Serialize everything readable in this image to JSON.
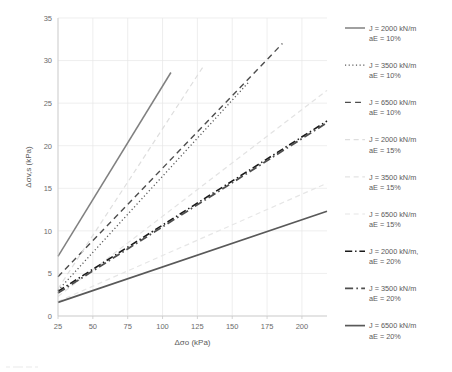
{
  "chart_data": {
    "type": "line",
    "title": "",
    "xlabel": "Δσo (kPa)",
    "ylabel": "Δσv,s (kPa)",
    "xlim": [
      25,
      218
    ],
    "ylim": [
      0,
      35
    ],
    "xticks": [
      25,
      50,
      75,
      100,
      125,
      150,
      175,
      200
    ],
    "yticks": [
      0,
      5,
      10,
      15,
      20,
      25,
      30,
      35
    ],
    "grid": true,
    "legend_position": "right",
    "series": [
      {
        "name": "J = 2000 kN/m aE = 10%",
        "label_line1": "J = 2000 kN/m",
        "label_line2": "aE = 10%",
        "color": "#808080",
        "width": 1.5,
        "dash": "none",
        "x": [
          25,
          106
        ],
        "y": [
          7.0,
          28.6
        ]
      },
      {
        "name": "J = 3500 kN/m aE = 10%",
        "label_line1": "J = 3500 kN/m",
        "label_line2": "aE = 10%",
        "color": "#595959",
        "width": 1.3,
        "dash": "dotted",
        "x": [
          25,
          162
        ],
        "y": [
          3.0,
          27.5
        ]
      },
      {
        "name": "J = 6500 kN/m aE = 10%",
        "label_line1": "J = 6500 kN/m",
        "label_line2": "aE = 10%",
        "color": "#4d4d4d",
        "width": 1.4,
        "dash": "dashed",
        "x": [
          25,
          186
        ],
        "y": [
          4.6,
          32.0
        ]
      },
      {
        "name": "J = 2000 kN/m aE = 15%",
        "label_line1": "J = 2000 kN/m",
        "label_line2": "aE = 15%",
        "color": "#dedede",
        "width": 1.2,
        "dash": "dashed",
        "x": [
          25,
          130
        ],
        "y": [
          3.2,
          29.5
        ]
      },
      {
        "name": "J = 3500 kN/m aE = 15%",
        "label_line1": "J = 3500 kN/m",
        "label_line2": "aE = 15%",
        "color": "#e3e3e3",
        "width": 1.2,
        "dash": "dashed",
        "x": [
          25,
          218
        ],
        "y": [
          2.3,
          26.5
        ]
      },
      {
        "name": "J = 6500 kN/m aE = 15%",
        "label_line1": "J = 6500 kN/m",
        "label_line2": "aE = 15%",
        "color": "#e6e6e6",
        "width": 1.2,
        "dash": "dashed",
        "x": [
          25,
          218
        ],
        "y": [
          1.7,
          15.6
        ]
      },
      {
        "name": "J = 2000 kN/m, aE = 20%",
        "label_line1": "J = 2000 kN/m,",
        "label_line2": "aE = 20%",
        "color": "#1a1a1a",
        "width": 1.6,
        "dash": "dashdot",
        "x": [
          25,
          218
        ],
        "y": [
          2.9,
          22.9
        ]
      },
      {
        "name": "J = 3500 kN/m aE = 20%",
        "label_line1": "J = 3500 kN/m",
        "label_line2": "aE = 20%",
        "color": "#4f4f4f",
        "width": 1.8,
        "dash": "dashdot",
        "x": [
          25,
          218
        ],
        "y": [
          2.7,
          22.7
        ]
      },
      {
        "name": "J = 6500 kN/m aE = 20%",
        "label_line1": "J = 6500 kN/m",
        "label_line2": "aE = 20%",
        "color": "#595959",
        "width": 1.7,
        "dash": "none",
        "x": [
          25,
          218
        ],
        "y": [
          1.6,
          12.3
        ]
      }
    ]
  },
  "legend": {
    "entries": [
      {
        "line1": "J = 2000 kN/m",
        "line2": "aE = 10%"
      },
      {
        "line1": "J = 3500 kN/m",
        "line2": "aE = 10%"
      },
      {
        "line1": "J = 6500 kN/m",
        "line2": "aE = 10%"
      },
      {
        "line1": "J = 2000 kN/m",
        "line2": "aE = 15%"
      },
      {
        "line1": "J = 3500 kN/m",
        "line2": "aE = 15%"
      },
      {
        "line1": "J = 6500 kN/m",
        "line2": "aE = 15%"
      },
      {
        "line1": "J = 2000 kN/m,",
        "line2": "aE = 20%"
      },
      {
        "line1": "J = 3500 kN/m",
        "line2": "aE = 20%"
      },
      {
        "line1": "J = 6500 kN/m",
        "line2": "aE = 20%"
      }
    ]
  }
}
